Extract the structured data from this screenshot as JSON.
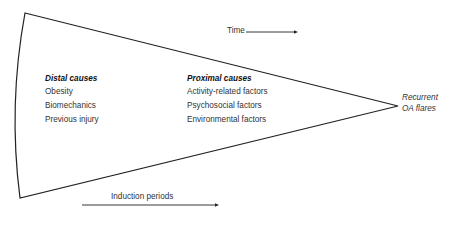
{
  "diagram": {
    "shape": "wedge",
    "time_label": "Time",
    "induction_label": "Induction periods",
    "outcome": {
      "line1": "Recurrent",
      "line2": "OA flares"
    },
    "distal": {
      "header": "Distal causes",
      "items": [
        "Obesity",
        "Biomechanics",
        "Previous injury"
      ]
    },
    "proximal": {
      "header": "Proximal causes",
      "items": [
        "Activity-related factors",
        "Psychosocial factors",
        "Environmental factors"
      ]
    },
    "colors": {
      "line": "#222222",
      "text": "#333333",
      "background": "#ffffff"
    }
  }
}
